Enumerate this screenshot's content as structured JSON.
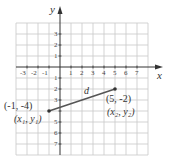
{
  "diagram": {
    "type": "coordinate-plane",
    "axes": {
      "x_label": "x",
      "y_label": "y"
    },
    "x_ticks": [
      "-3",
      "-2",
      "-1",
      "1",
      "2",
      "3",
      "4",
      "5",
      "6",
      "7"
    ],
    "y_ticks_positive": [
      "3",
      "2",
      "1"
    ],
    "y_ticks_negative": [
      "1",
      "2",
      "3",
      "5",
      "6",
      "7"
    ],
    "grid_range": {
      "x": [
        -4,
        8
      ],
      "y": [
        -8,
        4
      ]
    },
    "segment": {
      "label": "d",
      "start": {
        "coords": "(-1, -4)",
        "name": "(x₁, y₁)",
        "x": -1,
        "y": -4
      },
      "end": {
        "coords": "(5, -2)",
        "name": "(x₂, y₂)",
        "x": 5,
        "y": -2
      }
    },
    "colors": {
      "grid": "#c8c8c8",
      "axis": "#333333",
      "segment": "#555555"
    }
  }
}
